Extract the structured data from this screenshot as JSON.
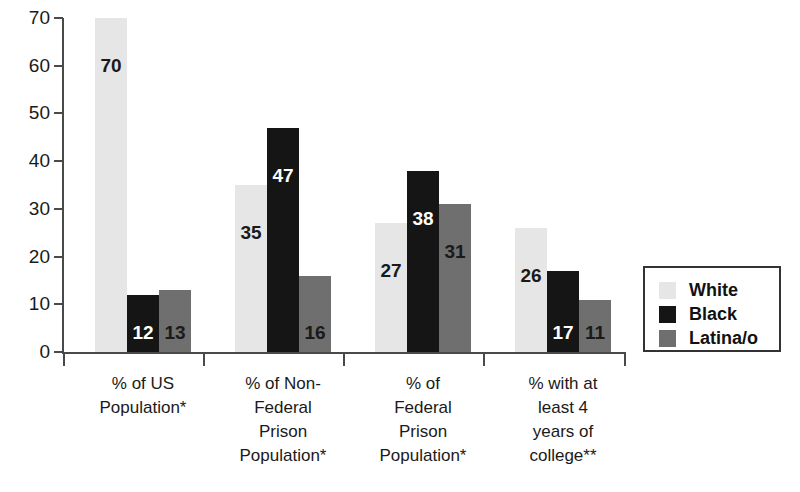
{
  "chart_data": {
    "type": "bar",
    "title": "",
    "subtitle": "",
    "xlabel": "",
    "ylabel": "",
    "ylim": [
      0,
      70
    ],
    "yticks": [
      "0",
      "10",
      "20",
      "30",
      "40",
      "50",
      "60",
      "70"
    ],
    "grid": false,
    "legend_position": "right",
    "categories": [
      "% of US Population*",
      "% of Non-Federal Prison Population*",
      "% of Federal Prison Population*",
      "% with at least 4 years of college**"
    ],
    "category_lines": [
      [
        "% of US",
        "Population*"
      ],
      [
        "% of Non-",
        "Federal",
        "Prison",
        "Population*"
      ],
      [
        "% of",
        "Federal",
        "Prison",
        "Population*"
      ],
      [
        "% with at",
        "least 4",
        "years of",
        "college**"
      ]
    ],
    "series": [
      {
        "name": "White",
        "color": "#e6e6e6",
        "label_color": "dark",
        "values": [
          70,
          35,
          27,
          26
        ]
      },
      {
        "name": "Black",
        "color": "#151515",
        "label_color": "light",
        "values": [
          12,
          47,
          38,
          17
        ]
      },
      {
        "name": "Latina/o",
        "color": "#6f6f6f",
        "label_color": "dark",
        "values": [
          13,
          16,
          31,
          11
        ]
      }
    ]
  },
  "legend": {
    "items": [
      {
        "label": "White",
        "swatch": "white"
      },
      {
        "label": "Black",
        "swatch": "black"
      },
      {
        "label": "Latina/o",
        "swatch": "latino"
      }
    ]
  },
  "axis": {
    "y_ticks": [
      "70",
      "60",
      "50",
      "40",
      "30",
      "20",
      "10",
      "0"
    ]
  },
  "colors": {
    "white_series": "#e6e6e6",
    "black_series": "#151515",
    "latino_series": "#6f6f6f",
    "axis": "#4a4a4a",
    "text": "#1a1a1a",
    "background": "#ffffff"
  }
}
